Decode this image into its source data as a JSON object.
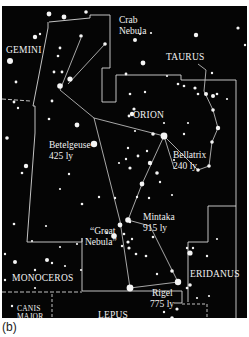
{
  "figure": {
    "caption": "(b)"
  },
  "constellations": [
    {
      "name": "GEMINI"
    },
    {
      "name": "TAURUS"
    },
    {
      "name": "ORION"
    },
    {
      "name": "MONOCEROS"
    },
    {
      "name": "ERIDANUS"
    },
    {
      "name": "CANIS MAJOR",
      "line1": "CANIS",
      "line2": "MAJOR"
    },
    {
      "name": "LEPUS"
    }
  ],
  "objects": [
    {
      "name": "Crab Nebula",
      "line1": "Crab",
      "line2": "Nebula"
    },
    {
      "name": "Great Nebula",
      "line1": "“Great",
      "line2": "Nebula”"
    }
  ],
  "stars": [
    {
      "name": "Betelgeuse",
      "distance": "425 ly"
    },
    {
      "name": "Bellatrix",
      "distance": "240 ly"
    },
    {
      "name": "Mintaka",
      "distance": "915 ly"
    },
    {
      "name": "Rigel",
      "distance": "775 ly"
    }
  ],
  "colors": {
    "sky": "#050505",
    "lines": "#d8d8d8",
    "text": "#f2f2f2"
  }
}
